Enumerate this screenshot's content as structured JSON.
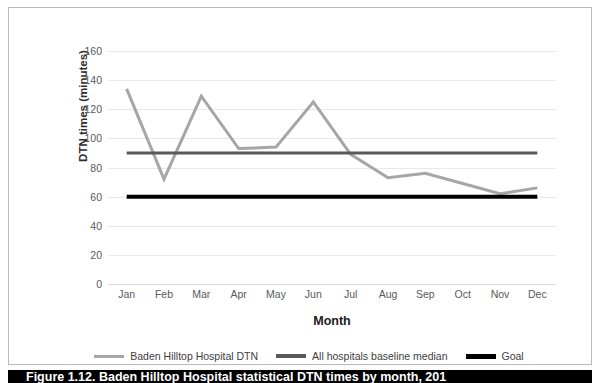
{
  "chart_data": {
    "type": "line",
    "title": "",
    "xlabel": "Month",
    "ylabel": "DTN times (minutes)",
    "categories": [
      "Jan",
      "Feb",
      "Mar",
      "Apr",
      "May",
      "Jun",
      "Jul",
      "Aug",
      "Sep",
      "Oct",
      "Nov",
      "Dec"
    ],
    "yticks": [
      0,
      20,
      40,
      60,
      80,
      100,
      120,
      140,
      160
    ],
    "ylim": [
      0,
      160
    ],
    "grid": true,
    "legend_position": "bottom",
    "series": [
      {
        "name": "Baden Hilltop Hospital DTN",
        "color": "#a6a6a6",
        "width": 3,
        "values": [
          134,
          72,
          129,
          93,
          94,
          125,
          89,
          73,
          76,
          69,
          62,
          66
        ]
      },
      {
        "name": "All hospitals baseline median",
        "color": "#595959",
        "width": 3,
        "values": [
          90,
          90,
          90,
          90,
          90,
          90,
          90,
          90,
          90,
          90,
          90,
          90
        ]
      },
      {
        "name": "Goal",
        "color": "#000000",
        "width": 4,
        "values": [
          60,
          60,
          60,
          60,
          60,
          60,
          60,
          60,
          60,
          60,
          60,
          60
        ]
      }
    ]
  },
  "legend": {
    "items": [
      {
        "label": "Baden Hilltop Hospital DTN",
        "color": "#a6a6a6",
        "thickness": 3
      },
      {
        "label": "All hospitals baseline median",
        "color": "#595959",
        "thickness": 4
      },
      {
        "label": "Goal",
        "color": "#000000",
        "thickness": 5
      }
    ]
  },
  "caption": {
    "text": "Figure 1.12. Baden Hilltop Hospital statistical DTN times by month, 201"
  }
}
